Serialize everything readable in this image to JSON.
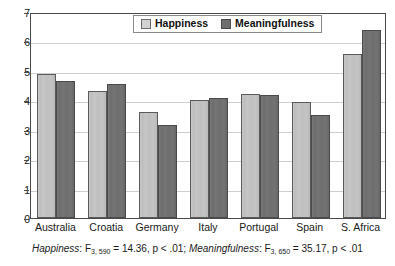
{
  "chart_data": {
    "type": "bar",
    "title": "",
    "xlabel": "",
    "ylabel": "",
    "ylim": [
      0,
      7
    ],
    "yticks": [
      0,
      1,
      2,
      3,
      4,
      5,
      6,
      7
    ],
    "grid": true,
    "legend_position": "top-center",
    "categories": [
      "Australia",
      "Croatia",
      "Germany",
      "Italy",
      "Portugal",
      "Spain",
      "S. Africa"
    ],
    "series": [
      {
        "name": "Happiness",
        "color": "#c6c6c6",
        "values": [
          4.9,
          4.3,
          3.61,
          4.0,
          4.22,
          3.95,
          5.59
        ]
      },
      {
        "name": "Meaningfulness",
        "color": "#6e6e6e",
        "values": [
          4.65,
          4.55,
          3.17,
          4.09,
          4.18,
          3.5,
          6.38
        ]
      }
    ],
    "annotations": {
      "caption_parts": [
        {
          "text": "Happiness",
          "style": "italic"
        },
        {
          "text": ": F",
          "style": "normal"
        },
        {
          "text": "3, 590",
          "style": "subscript"
        },
        {
          "text": " = 14.36,  p < .01; ",
          "style": "normal"
        },
        {
          "text": "Meaningfulness",
          "style": "italic"
        },
        {
          "text": ": F",
          "style": "normal"
        },
        {
          "text": "3, 650",
          "style": "subscript"
        },
        {
          "text": " = 35.17,  p < .01",
          "style": "normal"
        }
      ],
      "caption_plain": "Happiness: F3, 590 = 14.36,  p < .01; Meaningfulness: F3, 650 = 35.17,  p < .01"
    }
  },
  "axis": {
    "tick_labels": [
      "7",
      "6",
      "5",
      "4",
      "3",
      "2",
      "1",
      "0"
    ]
  },
  "legend": {
    "items": [
      {
        "label": "Happiness",
        "swatch": "light-gray-swatch"
      },
      {
        "label": "Meaningfulness",
        "swatch": "dark-gray-swatch"
      }
    ]
  },
  "caption": {
    "stat1_label": "Happiness",
    "stat1_f": ": F",
    "stat1_df": "3, 590",
    "stat1_value": " = 14.36,  p < .01; ",
    "stat2_label": "Meaningfulness",
    "stat2_f": ": F",
    "stat2_df": "3, 650",
    "stat2_value": " = 35.17,  p < .01"
  }
}
